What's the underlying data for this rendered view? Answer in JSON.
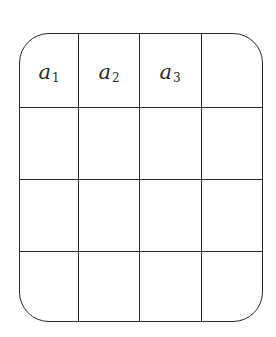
{
  "diagram": {
    "type": "grid",
    "rows": 4,
    "columns": 4,
    "corner_style": "rounded",
    "line_color": "#2a2a2a",
    "cells": [
      [
        {
          "base": "a",
          "sub": "1"
        },
        {
          "base": "a",
          "sub": "2"
        },
        {
          "base": "a",
          "sub": "3"
        },
        {
          "base": "",
          "sub": ""
        }
      ],
      [
        {
          "base": "",
          "sub": ""
        },
        {
          "base": "",
          "sub": ""
        },
        {
          "base": "",
          "sub": ""
        },
        {
          "base": "",
          "sub": ""
        }
      ],
      [
        {
          "base": "",
          "sub": ""
        },
        {
          "base": "",
          "sub": ""
        },
        {
          "base": "",
          "sub": ""
        },
        {
          "base": "",
          "sub": ""
        }
      ],
      [
        {
          "base": "",
          "sub": ""
        },
        {
          "base": "",
          "sub": ""
        },
        {
          "base": "",
          "sub": ""
        },
        {
          "base": "",
          "sub": ""
        }
      ]
    ]
  }
}
